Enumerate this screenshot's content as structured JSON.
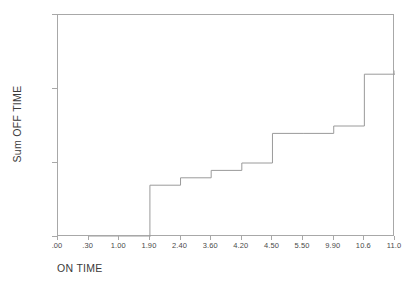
{
  "chart_data": {
    "type": "line",
    "subtype": "step",
    "title": "",
    "xlabel": "ON TIME",
    "ylabel": "Sum OFF TIME",
    "categories": [
      ".00",
      ".30",
      "1.00",
      "1.90",
      "2.40",
      "3.60",
      "4.20",
      "4.50",
      "5.50",
      "9.90",
      "10.6",
      "11.0"
    ],
    "values": [
      0,
      0,
      7,
      8,
      9,
      10,
      14,
      14,
      15,
      22,
      22.5,
      22.5
    ],
    "series": [
      {
        "name": "Sum OFF TIME",
        "points": [
          {
            "x": ".00",
            "y": null
          },
          {
            "x": ".30",
            "y": 0
          },
          {
            "x": "1.00",
            "y": 0
          },
          {
            "x": "1.90",
            "y": 7
          },
          {
            "x": "2.40",
            "y": 8
          },
          {
            "x": "3.60",
            "y": 9
          },
          {
            "x": "4.20",
            "y": 10
          },
          {
            "x": "4.50",
            "y": 14
          },
          {
            "x": "5.50",
            "y": 14
          },
          {
            "x": "9.90",
            "y": 15
          },
          {
            "x": "10.6",
            "y": 22
          },
          {
            "x": "11.0",
            "y": 22.5
          }
        ]
      }
    ],
    "ylim": [
      0,
      30
    ],
    "yticks": [
      "0",
      "10",
      "20",
      "30"
    ],
    "ytick_values": [
      0,
      10,
      20,
      30
    ],
    "xtick_labels": [
      ".00",
      ".30",
      "1.00",
      "1.90",
      "2.40",
      "3.60",
      "4.20",
      "4.50",
      "5.50",
      "9.90",
      "10.6",
      "11.0"
    ],
    "grid": false,
    "legend": false,
    "line_color": "#9a9a9a",
    "frame_color": "#a8a8a8",
    "background": "#ffffff"
  }
}
